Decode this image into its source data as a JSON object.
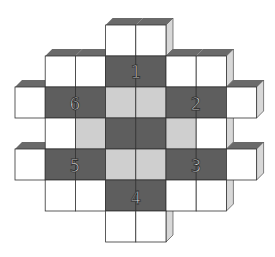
{
  "diagram": {
    "type": "cube-net-puzzle",
    "colors": {
      "white_face": "#ffffff",
      "dark_face": "#5e5e5e",
      "light_face": "#cfcfcf",
      "shadow": "#6a6a6a",
      "side": "#d8d8d8",
      "line": "#333333",
      "label_fill": "#e8e8e8",
      "label_stroke": "#333333"
    },
    "grid": {
      "x0": 15,
      "y0": 25,
      "cell_w": 30.2,
      "cell_h": 31
    },
    "cells": [
      {
        "col": 3,
        "row": 0,
        "shade": "white"
      },
      {
        "col": 4,
        "row": 0,
        "shade": "white"
      },
      {
        "col": 1,
        "row": 1,
        "shade": "white"
      },
      {
        "col": 2,
        "row": 1,
        "shade": "white"
      },
      {
        "col": 3,
        "row": 1,
        "shade": "dark"
      },
      {
        "col": 4,
        "row": 1,
        "shade": "dark"
      },
      {
        "col": 5,
        "row": 1,
        "shade": "white"
      },
      {
        "col": 6,
        "row": 1,
        "shade": "white"
      },
      {
        "col": 0,
        "row": 2,
        "shade": "white"
      },
      {
        "col": 1,
        "row": 2,
        "shade": "dark"
      },
      {
        "col": 2,
        "row": 2,
        "shade": "dark"
      },
      {
        "col": 3,
        "row": 2,
        "shade": "light"
      },
      {
        "col": 4,
        "row": 2,
        "shade": "light"
      },
      {
        "col": 5,
        "row": 2,
        "shade": "dark"
      },
      {
        "col": 6,
        "row": 2,
        "shade": "dark"
      },
      {
        "col": 7,
        "row": 2,
        "shade": "white"
      },
      {
        "col": 1,
        "row": 3,
        "shade": "white"
      },
      {
        "col": 2,
        "row": 3,
        "shade": "light"
      },
      {
        "col": 3,
        "row": 3,
        "shade": "dark"
      },
      {
        "col": 4,
        "row": 3,
        "shade": "dark"
      },
      {
        "col": 5,
        "row": 3,
        "shade": "light"
      },
      {
        "col": 6,
        "row": 3,
        "shade": "white"
      },
      {
        "col": 0,
        "row": 4,
        "shade": "white"
      },
      {
        "col": 1,
        "row": 4,
        "shade": "dark"
      },
      {
        "col": 2,
        "row": 4,
        "shade": "dark"
      },
      {
        "col": 3,
        "row": 4,
        "shade": "light"
      },
      {
        "col": 4,
        "row": 4,
        "shade": "light"
      },
      {
        "col": 5,
        "row": 4,
        "shade": "dark"
      },
      {
        "col": 6,
        "row": 4,
        "shade": "dark"
      },
      {
        "col": 7,
        "row": 4,
        "shade": "white"
      },
      {
        "col": 1,
        "row": 5,
        "shade": "white"
      },
      {
        "col": 2,
        "row": 5,
        "shade": "white"
      },
      {
        "col": 3,
        "row": 5,
        "shade": "dark"
      },
      {
        "col": 4,
        "row": 5,
        "shade": "dark"
      },
      {
        "col": 5,
        "row": 5,
        "shade": "white"
      },
      {
        "col": 6,
        "row": 5,
        "shade": "white"
      },
      {
        "col": 3,
        "row": 6,
        "shade": "white"
      },
      {
        "col": 4,
        "row": 6,
        "shade": "white"
      }
    ],
    "labels": [
      {
        "text": "1",
        "x": 136,
        "y": 71
      },
      {
        "text": "2",
        "x": 196,
        "y": 103
      },
      {
        "text": "3",
        "x": 196,
        "y": 165
      },
      {
        "text": "4",
        "x": 136,
        "y": 197
      },
      {
        "text": "5",
        "x": 75,
        "y": 165
      },
      {
        "text": "6",
        "x": 75,
        "y": 103
      }
    ]
  }
}
